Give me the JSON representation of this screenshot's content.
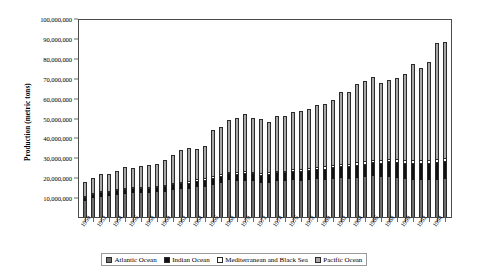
{
  "chart_data": {
    "type": "bar",
    "stacked": true,
    "title": "",
    "xlabel": "",
    "ylabel": "Production (metric tons)",
    "ylim": [
      0,
      100000000
    ],
    "ytick_step": 10000000,
    "ytick_labels": [
      "100,000,000",
      "90,000,000",
      "80,000,000",
      "70,000,000",
      "60,000,000",
      "50,000,000",
      "40,000,000",
      "30,000,000",
      "20,000,000",
      "10,000,000"
    ],
    "ytick_values": [
      100000000,
      90000000,
      80000000,
      70000000,
      60000000,
      50000000,
      40000000,
      30000000,
      20000000,
      10000000
    ],
    "grid": false,
    "legend_position": "bottom",
    "categories": [
      "1950",
      "1951",
      "1952",
      "1953",
      "1954",
      "1955",
      "1956",
      "1957",
      "1958",
      "1959",
      "1960",
      "1961",
      "1962",
      "1963",
      "1964",
      "1965",
      "1966",
      "1967",
      "1968",
      "1969",
      "1970",
      "1971",
      "1972",
      "1973",
      "1974",
      "1975",
      "1976",
      "1977",
      "1978",
      "1979",
      "1980",
      "1981",
      "1982",
      "1983",
      "1984",
      "1985",
      "1986",
      "1987",
      "1988",
      "1989",
      "1990",
      "1991",
      "1992",
      "1993",
      "1994",
      "1995"
    ],
    "xtick_labels_shown": [
      "1950",
      "",
      "1952",
      "",
      "1954",
      "",
      "1956",
      "",
      "1958",
      "",
      "1960",
      "",
      "1962",
      "",
      "1964",
      "",
      "1966",
      "",
      "1968",
      "",
      "1970",
      "",
      "1972",
      "",
      "1974",
      "",
      "1976",
      "",
      "1978",
      "",
      "1980",
      "",
      "1982",
      "",
      "1984",
      "",
      "1986",
      "",
      "1988",
      "",
      "1990",
      "",
      "1992",
      "",
      "1994",
      ""
    ],
    "series": [
      {
        "name": "Atlantic Ocean",
        "color": "#6d6d6d",
        "values": [
          8200000,
          9900000,
          10400000,
          10600000,
          11200000,
          11900000,
          12300000,
          12200000,
          12000000,
          12600000,
          12900000,
          13500000,
          14100000,
          14200000,
          15100000,
          15400000,
          16300000,
          17400000,
          18600000,
          18200000,
          18400000,
          18200000,
          17200000,
          17500000,
          18200000,
          18100000,
          18900000,
          18300000,
          18700000,
          19100000,
          19000000,
          19400000,
          19700000,
          19500000,
          20000000,
          20200000,
          20600000,
          20100000,
          20400000,
          19900000,
          19300000,
          19000000,
          18800000,
          18600000,
          18900000,
          19100000
        ]
      },
      {
        "name": "Indian Ocean",
        "color": "#111111",
        "values": [
          1300000,
          1500000,
          1600000,
          1700000,
          1800000,
          1900000,
          2000000,
          2100000,
          2200000,
          2300000,
          2400000,
          2500000,
          2600000,
          2700000,
          2800000,
          2900000,
          3000000,
          3100000,
          3200000,
          3300000,
          3400000,
          3500000,
          3600000,
          3700000,
          3900000,
          4000000,
          4200000,
          4400000,
          4600000,
          4800000,
          5000000,
          5300000,
          5600000,
          5800000,
          6100000,
          6400000,
          6700000,
          7000000,
          7300000,
          7600000,
          7800000,
          8000000,
          8200000,
          8400000,
          8600000,
          8800000
        ]
      },
      {
        "name": "Mediterranean and Black Sea",
        "color": "#ffffff",
        "values": [
          700000,
          800000,
          800000,
          900000,
          900000,
          1000000,
          1000000,
          1000000,
          1000000,
          1100000,
          1100000,
          1100000,
          1200000,
          1200000,
          1200000,
          1300000,
          1300000,
          1300000,
          1300000,
          1400000,
          1400000,
          1400000,
          1400000,
          1500000,
          1500000,
          1500000,
          1500000,
          1600000,
          1600000,
          1600000,
          1700000,
          1700000,
          1700000,
          1800000,
          1800000,
          1800000,
          1900000,
          1900000,
          1900000,
          2000000,
          2000000,
          2000000,
          1900000,
          1900000,
          1900000,
          1900000
        ]
      },
      {
        "name": "Pacific Ocean",
        "color": "#a8a8a8",
        "values": [
          6600000,
          7000000,
          8100000,
          8000000,
          8900000,
          9900000,
          9300000,
          9900000,
          10500000,
          10300000,
          12200000,
          14000000,
          15800000,
          16600000,
          15000000,
          16200000,
          23200000,
          23300000,
          25800000,
          26800000,
          28400000,
          26700000,
          26900000,
          25000000,
          27200000,
          27300000,
          28100000,
          28800000,
          29600000,
          31000000,
          31400000,
          32600000,
          35800000,
          35700000,
          39100000,
          40300000,
          41500000,
          38600000,
          39300000,
          40500000,
          42900000,
          48000000,
          46100000,
          49100000,
          58600000,
          58600000
        ]
      }
    ]
  },
  "legend": {
    "items": [
      {
        "label": "Atlantic Ocean",
        "swatch_color": "#6d6d6d",
        "swatch_name": "legend-swatch-atlantic"
      },
      {
        "label": "Indian Ocean",
        "swatch_color": "#111111",
        "swatch_name": "legend-swatch-indian"
      },
      {
        "label": "Mediterranean and Black Sea",
        "swatch_color": "#ffffff",
        "swatch_name": "legend-swatch-mediterranean"
      },
      {
        "label": "Pacific Ocean",
        "swatch_color": "#a8a8a8",
        "swatch_name": "legend-swatch-pacific"
      }
    ]
  },
  "axes": {
    "y_title": "Production (metric tons)"
  }
}
